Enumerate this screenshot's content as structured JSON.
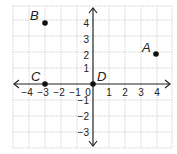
{
  "figure": {
    "type": "coordinate-plane",
    "grid": {
      "x_min": -5,
      "x_max": 5,
      "y_min": -4,
      "y_max": 5,
      "unit_px": 16,
      "origin_px": [
        93,
        84
      ]
    },
    "x_ticks": [
      "−4",
      "−3",
      "−2",
      "−1",
      "0",
      "1",
      "2",
      "3",
      "4"
    ],
    "y_ticks": [
      "4",
      "3",
      "2",
      "1",
      "−1",
      "−2",
      "−3"
    ],
    "points": [
      {
        "label": "A",
        "x": 4,
        "y": 2
      },
      {
        "label": "B",
        "x": -3,
        "y": 4
      },
      {
        "label": "C",
        "x": -3,
        "y": 0
      },
      {
        "label": "D",
        "x": 0,
        "y": 0
      }
    ]
  }
}
